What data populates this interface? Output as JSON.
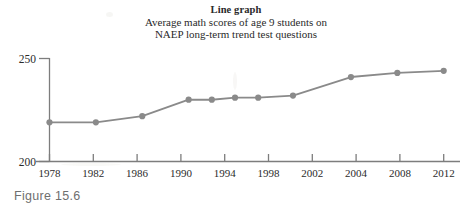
{
  "figure": {
    "caption": "Figure 15.6",
    "title_main": "Line graph",
    "title_sub_line1": "Average math scores of age 9 students on",
    "title_sub_line2": "NAEP long-term trend test questions"
  },
  "colors": {
    "line": "#8a8a8a",
    "marker": "#8a8a8a",
    "axis": "#7d7d7d",
    "text": "#2b2b2b",
    "caption": "#6f6f6f",
    "background": "#ffffff"
  },
  "chart_data": {
    "type": "line",
    "title": "Line graph",
    "subtitle": "Average math scores of age 9 students on NAEP long-term trend test questions",
    "xlabel": "",
    "ylabel": "",
    "ylim": [
      200,
      250
    ],
    "yticks": [
      200,
      250
    ],
    "ytick_labels": [
      "200",
      "250"
    ],
    "xtick_labels": [
      "1978",
      "1982",
      "1986",
      "1990",
      "1994",
      "1998",
      "2002",
      "2004",
      "2008",
      "2012"
    ],
    "grid": false,
    "legend": "none",
    "markers": "circle",
    "x": [
      1978,
      1982,
      1986,
      1990,
      1992,
      1994,
      1996,
      1999,
      2004,
      2008,
      2012
    ],
    "values": [
      219,
      219,
      222,
      230,
      230,
      231,
      231,
      232,
      241,
      243,
      244
    ],
    "points": [
      {
        "year": "1978",
        "score": 219
      },
      {
        "year": "1982",
        "score": 219
      },
      {
        "year": "1986",
        "score": 222
      },
      {
        "year": "1990",
        "score": 230
      },
      {
        "year": "1992",
        "score": 230
      },
      {
        "year": "1994",
        "score": 231
      },
      {
        "year": "1996",
        "score": 231
      },
      {
        "year": "1999",
        "score": 232
      },
      {
        "year": "2004",
        "score": 241
      },
      {
        "year": "2008",
        "score": 243
      },
      {
        "year": "2012",
        "score": 244
      }
    ]
  }
}
